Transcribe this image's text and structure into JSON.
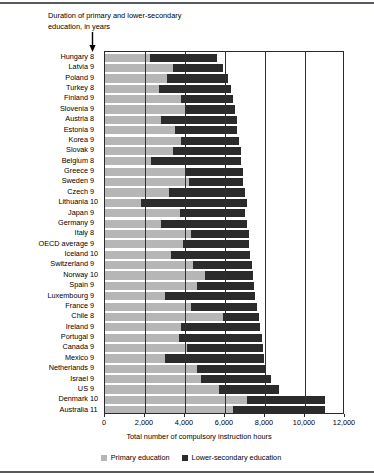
{
  "annotation": {
    "line1": "Duration of primary and lower-secondary",
    "line2": "education, in years",
    "arrow_icon": "down-arrow-icon"
  },
  "legend": {
    "primary_label": "Primary education",
    "lower_label": "Lower-secondary education"
  },
  "colors": {
    "primary": "#b6b6b6",
    "lower_secondary": "#2b2b2b",
    "axis": "#2a2a2a",
    "rule": "#555a5e"
  },
  "chart_data": {
    "type": "bar",
    "orientation": "horizontal",
    "stacked": true,
    "title": "",
    "subtitle": "",
    "xlabel": "Total number of compulsory instruction hours",
    "ylabel": "",
    "xlim": [
      0,
      12000
    ],
    "xticks": [
      0,
      2000,
      4000,
      6000,
      8000,
      10000,
      12000
    ],
    "xtick_labels": [
      "0",
      "2,000",
      "4,000",
      "6,000",
      "8,000",
      "10,000",
      "12,000"
    ],
    "grid": true,
    "legend_position": "bottom",
    "categories": [
      "Hungary",
      "Latvia",
      "Poland",
      "Turkey",
      "Finland",
      "Slovenia",
      "Austria",
      "Estonia",
      "Korea",
      "Slovak",
      "Belgium",
      "Greece",
      "Sweden",
      "Czech",
      "Lithuania",
      "Japan",
      "Germany",
      "Italy",
      "OECD average",
      "Iceland",
      "Switzerland",
      "Norway",
      "Spain",
      "Luxembourg",
      "France",
      "Chile",
      "Ireland",
      "Portugal",
      "Canada",
      "Mexico",
      "Netherlands",
      "Israel",
      "US",
      "Denmark",
      "Australia"
    ],
    "durations_years": [
      8,
      9,
      9,
      8,
      9,
      9,
      8,
      9,
      9,
      9,
      8,
      9,
      9,
      9,
      10,
      9,
      9,
      8,
      9,
      10,
      9,
      10,
      9,
      9,
      9,
      8,
      9,
      9,
      9,
      9,
      9,
      9,
      9,
      10,
      11
    ],
    "series": [
      {
        "name": "Primary education",
        "color": "#b6b6b6",
        "values": [
          2250,
          3400,
          3100,
          2700,
          3800,
          4000,
          2800,
          3500,
          3800,
          3400,
          2300,
          4000,
          4200,
          3200,
          1800,
          3750,
          2800,
          4300,
          3900,
          3300,
          4400,
          5000,
          4600,
          3000,
          4300,
          5900,
          3800,
          3700,
          4100,
          3000,
          4600,
          4800,
          5700,
          7100,
          6400
        ]
      },
      {
        "name": "Lower-secondary education",
        "color": "#2b2b2b",
        "values": [
          3350,
          2500,
          3050,
          3600,
          2600,
          2500,
          3800,
          3100,
          2900,
          3400,
          4500,
          2900,
          2700,
          3800,
          5300,
          3250,
          4300,
          2900,
          3300,
          3950,
          2950,
          2400,
          2850,
          4500,
          3300,
          1800,
          3950,
          4150,
          3800,
          4950,
          3400,
          3500,
          3000,
          3900,
          4600
        ]
      }
    ],
    "totals": [
      5600,
      5900,
      6150,
      6300,
      6400,
      6500,
      6600,
      6600,
      6700,
      6800,
      6800,
      6900,
      6900,
      7000,
      7100,
      7000,
      7100,
      7200,
      7200,
      7250,
      7350,
      7400,
      7450,
      7500,
      7600,
      7700,
      7750,
      7850,
      7900,
      7950,
      8000,
      8300,
      8700,
      11000,
      11000
    ]
  }
}
